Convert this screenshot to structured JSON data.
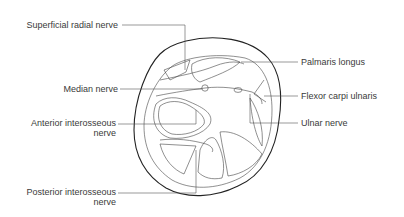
{
  "figure": {
    "labels_left": [
      {
        "id": "superficial-radial-nerve",
        "text": "Superficial radial nerve"
      },
      {
        "id": "median-nerve",
        "text": "Median nerve"
      },
      {
        "id": "anterior-interosseous-nerve",
        "line1": "Anterior interosseous",
        "line2": "nerve"
      },
      {
        "id": "posterior-interosseous-nerve",
        "line1": "Posterior interosseous",
        "line2": "nerve"
      }
    ],
    "labels_right": [
      {
        "id": "palmaris-longus",
        "text": "Palmaris longus"
      },
      {
        "id": "flexor-carpi-ulnaris",
        "text": "Flexor carpi ulnaris"
      },
      {
        "id": "ulnar-nerve",
        "text": "Ulnar nerve"
      }
    ]
  }
}
